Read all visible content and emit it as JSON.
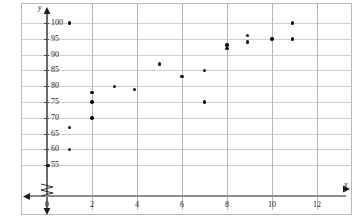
{
  "chart_data": {
    "type": "scatter",
    "title": "",
    "xlabel": "x",
    "ylabel": "y",
    "xlim": [
      0,
      13
    ],
    "ylim": [
      52,
      102
    ],
    "grid": true,
    "legend": "none",
    "y_axis_break": true,
    "x_ticks": [
      0,
      2,
      4,
      6,
      8,
      10,
      12
    ],
    "x_tick_labels": [
      "0",
      "2",
      "4",
      "6",
      "8",
      "10",
      "12"
    ],
    "y_ticks": [
      55,
      60,
      65,
      70,
      75,
      80,
      85,
      90,
      95,
      100
    ],
    "y_tick_labels": [
      "55",
      "60",
      "65",
      "70",
      "75",
      "80",
      "85",
      "90",
      "95",
      "100"
    ],
    "x_gridlines": [
      2,
      4,
      6,
      8,
      10,
      12
    ],
    "points": [
      {
        "x": 0.05,
        "y": 55
      },
      {
        "x": 1,
        "y": 60
      },
      {
        "x": 1,
        "y": 67
      },
      {
        "x": 1,
        "y": 100
      },
      {
        "x": 2,
        "y": 70
      },
      {
        "x": 2,
        "y": 75
      },
      {
        "x": 2,
        "y": 78
      },
      {
        "x": 3,
        "y": 80
      },
      {
        "x": 3.9,
        "y": 79
      },
      {
        "x": 5,
        "y": 87
      },
      {
        "x": 6,
        "y": 83
      },
      {
        "x": 7,
        "y": 75
      },
      {
        "x": 7,
        "y": 85
      },
      {
        "x": 8,
        "y": 92
      },
      {
        "x": 8,
        "y": 93
      },
      {
        "x": 8.9,
        "y": 94
      },
      {
        "x": 8.9,
        "y": 96
      },
      {
        "x": 10,
        "y": 95
      },
      {
        "x": 10.9,
        "y": 95
      },
      {
        "x": 10.9,
        "y": 100
      }
    ]
  }
}
